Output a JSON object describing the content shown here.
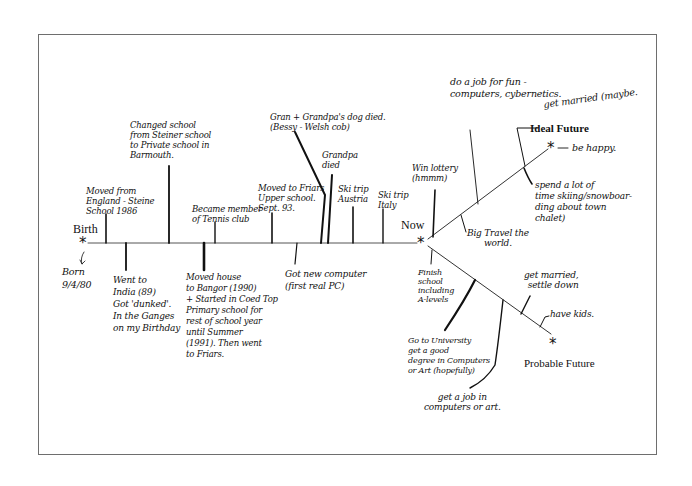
{
  "diagram": {
    "labels": {
      "birth": "Birth",
      "now": "Now",
      "ideal_future": "Ideal Future",
      "probable_future": "Probable Future"
    },
    "markers": {
      "star": "*"
    },
    "past_events_above": [
      {
        "id": "moved-england",
        "text": "Moved from\nEngland - Steine\nSchool 1986"
      },
      {
        "id": "changed-school",
        "text": "Changed school\nfrom Steiner school\nto Private school in\nBarmouth."
      },
      {
        "id": "tennis-club",
        "text": "Became member\nof Tennis club"
      },
      {
        "id": "upper-school",
        "text": "Moved to Friars\nUpper school.\nSept. 93."
      },
      {
        "id": "dog-died",
        "text": "Gran + Grandpa's dog died.\n(Bessy - Welsh cob)"
      },
      {
        "id": "grandpa-died",
        "text": "Grandpa\ndied"
      },
      {
        "id": "ski-austria",
        "text": "Ski trip\nAustria"
      },
      {
        "id": "ski-italy",
        "text": "Ski trip\nItaly"
      }
    ],
    "past_events_below": [
      {
        "id": "born",
        "text": "Born\n9/4/80"
      },
      {
        "id": "india",
        "text": "Went to\nIndia (89)\nGot 'dunked'.\nIn the Ganges\non my Birthday"
      },
      {
        "id": "moved-bangor",
        "text": "Moved house\nto Bangor (1990)\n+ Started in Coed Top\nPrimary school for\nrest of school year\nuntil Summer\n(1991). Then went\nto Friars."
      },
      {
        "id": "new-computer",
        "text": "Got new computer\n(first real PC)"
      }
    ],
    "ideal_future_events": [
      {
        "id": "win-lottery",
        "text": "Win lottery\n(hmmm)"
      },
      {
        "id": "job-for-fun",
        "text": "do a job for fun -\ncomputers, cybernetics."
      },
      {
        "id": "travel-world",
        "text": "Big Travel the\nworld."
      },
      {
        "id": "get-married-maybe",
        "text": "get married (maybe."
      },
      {
        "id": "spend-time-skiing",
        "text": "spend a lot of\ntime skiing/snowboar-\nding about town\nchalet)"
      },
      {
        "id": "be-happy",
        "text": "be happy."
      }
    ],
    "probable_future_events": [
      {
        "id": "finish-school",
        "text": "Finish\nschool\nincluding\nA-levels"
      },
      {
        "id": "university",
        "text": "Go to University\nget a good\ndegree in Computers\nor Art (hopefully)"
      },
      {
        "id": "job-computers-art",
        "text": "get a job in\ncomputers or art."
      },
      {
        "id": "married-settle",
        "text": "get married,\nsettle down"
      },
      {
        "id": "have-kids",
        "text": "have kids."
      }
    ]
  },
  "colors": {
    "ink": "#111111",
    "frame": "#6e6e6e",
    "background": "#ffffff"
  }
}
